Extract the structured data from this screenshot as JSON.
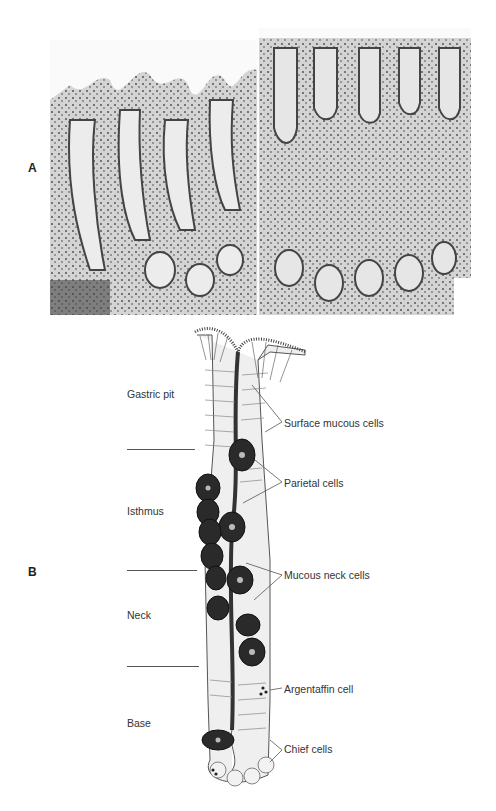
{
  "figure": {
    "panel_a": {
      "label": "A",
      "description": "Light micrographs of gastric mucosa (two adjacent fields)"
    },
    "panel_b": {
      "label": "B",
      "description": "Schematic of a gastric gland",
      "regions": [
        {
          "label": "Gastric pit"
        },
        {
          "label": "Isthmus"
        },
        {
          "label": "Neck"
        },
        {
          "label": "Base"
        }
      ],
      "callouts": [
        {
          "label": "Surface mucous cells"
        },
        {
          "label": "Parietal cells"
        },
        {
          "label": "Mucous neck cells"
        },
        {
          "label": "Argentaffin cell"
        },
        {
          "label": "Chief cells"
        }
      ]
    }
  }
}
